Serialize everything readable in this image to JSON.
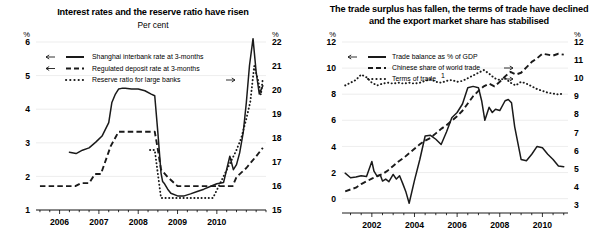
{
  "figure": {
    "left_panel": {
      "title": "Interest rates and the reserve ratio have risen",
      "subtitle": "Per cent",
      "left_unit": "%",
      "right_unit": "%"
    },
    "right_panel": {
      "title_line1": "The trade surplus has fallen, the terms of trade have declined",
      "title_line2": "and the export market share has stabilised",
      "left_unit": "%",
      "right_unit": "%"
    }
  },
  "chart_data": [
    {
      "type": "line",
      "title": "Interest rates and the reserve ratio have risen",
      "subtitle": "Per cent",
      "xlabel": "",
      "ylabel": "%",
      "xlim": [
        2005.4,
        2011.25
      ],
      "xticks": [
        2006,
        2007,
        2008,
        2009,
        2010
      ],
      "xticklabels": [
        "2006",
        "2007",
        "2008",
        "2009",
        "2010"
      ],
      "ylim": [
        1,
        6
      ],
      "yticks": [
        1,
        2,
        3,
        4,
        5,
        6
      ],
      "yticklabels": [
        "1",
        "2",
        "3",
        "4",
        "5",
        "6"
      ],
      "y2label": "%",
      "y2lim": [
        15,
        22
      ],
      "y2ticks": [
        15,
        16,
        17,
        18,
        19,
        20,
        21,
        22
      ],
      "y2ticklabels": [
        "15",
        "16",
        "17",
        "18",
        "19",
        "20",
        "21",
        "22"
      ],
      "grid": true,
      "legend_position": "upper-left",
      "series": [
        {
          "name": "Shanghai interbank rate at 3-months",
          "style": "solid",
          "axis": "left",
          "arrow": "left",
          "x": [
            2006.25,
            2006.42,
            2006.58,
            2006.75,
            2006.92,
            2007.08,
            2007.25,
            2007.33,
            2007.42,
            2007.5,
            2007.58,
            2007.67,
            2007.83,
            2008.0,
            2008.17,
            2008.33,
            2008.42,
            2008.5,
            2008.58,
            2008.62,
            2008.67,
            2008.75,
            2008.83,
            2009.0,
            2009.17,
            2009.33,
            2009.5,
            2009.67,
            2009.83,
            2010.0,
            2010.17,
            2010.33,
            2010.42,
            2010.5,
            2010.58,
            2010.67,
            2010.75,
            2010.83,
            2010.92,
            2011.0,
            2011.08,
            2011.17
          ],
          "y": [
            2.72,
            2.68,
            2.78,
            2.85,
            3.02,
            3.2,
            3.6,
            4.2,
            4.45,
            4.6,
            4.62,
            4.62,
            4.6,
            4.6,
            4.55,
            4.45,
            4.4,
            3.3,
            2.1,
            1.85,
            1.78,
            1.62,
            1.5,
            1.42,
            1.42,
            1.48,
            1.55,
            1.62,
            1.7,
            1.78,
            1.82,
            2.6,
            2.2,
            2.35,
            2.7,
            3.3,
            4.2,
            5.3,
            6.1,
            5.1,
            4.45,
            4.7
          ]
        },
        {
          "name": "Regulated deposit rate at 3-months",
          "style": "dashed",
          "axis": "left",
          "arrow": "left",
          "x": [
            2005.5,
            2006.0,
            2006.4,
            2006.55,
            2006.75,
            2006.9,
            2007.05,
            2007.3,
            2007.5,
            2007.6,
            2008.25,
            2008.42,
            2008.5,
            2008.58,
            2008.75,
            2009.0,
            2010.0,
            2010.4,
            2010.5,
            2010.75,
            2011.0,
            2011.17
          ],
          "y": [
            1.71,
            1.71,
            1.71,
            1.8,
            1.8,
            2.07,
            2.07,
            2.9,
            3.33,
            3.33,
            3.33,
            3.33,
            2.8,
            2.2,
            1.98,
            1.71,
            1.71,
            1.71,
            1.98,
            2.25,
            2.6,
            2.85
          ]
        },
        {
          "name": "Reserve ratio for large banks",
          "style": "dotted",
          "axis": "right",
          "arrow": "right",
          "x": [
            2008.3,
            2008.42,
            2008.5,
            2008.58,
            2008.67,
            2008.75,
            2009.0,
            2009.3,
            2009.58,
            2009.7,
            2009.9,
            2010.05,
            2010.2,
            2010.35,
            2010.5,
            2010.62,
            2010.75,
            2010.85,
            2010.95,
            2011.05,
            2011.12,
            2011.17
          ],
          "y": [
            17.5,
            17.5,
            16.5,
            15.5,
            15.5,
            15.5,
            15.5,
            15.5,
            15.5,
            15.5,
            15.5,
            16.0,
            16.5,
            17.0,
            17.5,
            18.0,
            18.8,
            19.5,
            21.0,
            20.4,
            19.8,
            20.5
          ]
        }
      ]
    },
    {
      "type": "line",
      "title": "The trade surplus has fallen, the terms of trade have declined and the export market share has stabilised",
      "subtitle": "",
      "xlabel": "",
      "ylabel": "%",
      "xlim": [
        2000.6,
        2011.2
      ],
      "xticks": [
        2002,
        2004,
        2006,
        2008,
        2010
      ],
      "xticklabels": [
        "2002",
        "2004",
        "2006",
        "2008",
        "2010"
      ],
      "ylim": [
        -1.1,
        12
      ],
      "yticks": [
        0,
        2,
        4,
        6,
        8,
        10,
        12
      ],
      "yticklabels": [
        "0",
        "2",
        "4",
        "6",
        "8",
        "10",
        "12"
      ],
      "y2label": "%",
      "y2lim": [
        2.55,
        12
      ],
      "y2ticks": [
        3,
        4,
        5,
        6,
        7,
        8,
        9,
        10,
        11,
        12
      ],
      "y2ticklabels": [
        "3",
        "4",
        "5",
        "6",
        "7",
        "8",
        "9",
        "10",
        "11",
        "12"
      ],
      "grid": true,
      "legend_position": "upper-left",
      "footnote_marker": "1",
      "series": [
        {
          "name": "Trade balance as % of GDP",
          "style": "solid",
          "axis": "left",
          "arrow": "left",
          "x": [
            2000.75,
            2001.0,
            2001.25,
            2001.5,
            2001.75,
            2002.0,
            2002.1,
            2002.25,
            2002.4,
            2002.5,
            2002.65,
            2002.8,
            2003.0,
            2003.15,
            2003.3,
            2003.45,
            2003.6,
            2003.75,
            2004.0,
            2004.25,
            2004.5,
            2004.75,
            2005.0,
            2005.25,
            2005.5,
            2005.75,
            2006.0,
            2006.25,
            2006.5,
            2006.75,
            2007.0,
            2007.15,
            2007.3,
            2007.5,
            2007.65,
            2007.8,
            2008.0,
            2008.25,
            2008.4,
            2008.55,
            2008.7,
            2009.0,
            2009.25,
            2009.5,
            2009.75,
            2010.0,
            2010.25,
            2010.5,
            2010.75,
            2011.0
          ],
          "y": [
            1.95,
            1.6,
            1.65,
            1.75,
            1.7,
            2.85,
            2.1,
            1.7,
            1.8,
            1.35,
            1.5,
            1.3,
            1.85,
            1.5,
            1.75,
            1.15,
            0.5,
            -0.35,
            1.4,
            3.0,
            4.8,
            4.85,
            4.55,
            4.15,
            5.1,
            6.2,
            6.6,
            7.25,
            8.5,
            8.6,
            8.5,
            7.5,
            6.0,
            7.0,
            6.6,
            6.85,
            6.75,
            7.5,
            7.6,
            7.35,
            5.5,
            3.0,
            2.9,
            3.4,
            4.0,
            3.9,
            3.4,
            3.0,
            2.5,
            2.45
          ]
        },
        {
          "name": "Chinese share of world trade",
          "style": "dashed",
          "axis": "right",
          "arrow": "right",
          "x": [
            2000.75,
            2001.0,
            2001.25,
            2001.5,
            2001.75,
            2002.0,
            2002.25,
            2002.5,
            2002.75,
            2003.0,
            2003.25,
            2003.5,
            2003.75,
            2004.0,
            2004.25,
            2004.5,
            2004.75,
            2005.0,
            2005.25,
            2005.5,
            2005.75,
            2006.0,
            2006.25,
            2006.5,
            2006.75,
            2007.0,
            2007.25,
            2007.5,
            2007.75,
            2008.0,
            2008.25,
            2008.5,
            2008.75,
            2009.0,
            2009.25,
            2009.5,
            2009.75,
            2010.0,
            2010.25,
            2010.5,
            2010.75,
            2011.0
          ],
          "y": [
            3.75,
            3.85,
            3.95,
            4.15,
            4.3,
            4.45,
            4.6,
            4.7,
            4.9,
            5.15,
            5.4,
            5.6,
            5.85,
            6.1,
            6.35,
            6.55,
            6.7,
            6.95,
            7.2,
            7.4,
            7.65,
            7.9,
            8.2,
            8.6,
            9.0,
            9.3,
            9.55,
            9.7,
            9.55,
            9.8,
            10.1,
            10.35,
            10.2,
            10.3,
            10.6,
            10.9,
            11.1,
            11.35,
            11.3,
            11.25,
            11.35,
            11.3
          ]
        },
        {
          "name": "Terms of trade",
          "style": "dotted",
          "axis": "right",
          "arrow": "right",
          "x": [
            2000.75,
            2001.0,
            2001.25,
            2001.5,
            2001.75,
            2002.0,
            2002.25,
            2002.5,
            2002.75,
            2003.0,
            2003.25,
            2003.5,
            2003.75,
            2004.0,
            2004.25,
            2004.5,
            2004.75,
            2005.0,
            2005.25,
            2005.5,
            2005.75,
            2006.0,
            2006.25,
            2006.5,
            2006.75,
            2007.0,
            2007.25,
            2007.5,
            2007.75,
            2008.0,
            2008.25,
            2008.5,
            2008.75,
            2009.0,
            2009.25,
            2009.5,
            2009.75,
            2010.0,
            2010.25,
            2010.5,
            2010.75,
            2011.0
          ],
          "y": [
            9.6,
            9.75,
            9.9,
            10.2,
            10.05,
            9.75,
            9.6,
            9.7,
            9.75,
            9.7,
            9.75,
            9.7,
            9.75,
            9.7,
            9.75,
            9.85,
            9.95,
            9.8,
            9.75,
            9.85,
            9.9,
            9.8,
            9.85,
            10.0,
            10.15,
            10.3,
            10.45,
            10.25,
            10.0,
            9.9,
            10.0,
            9.75,
            9.6,
            9.8,
            9.7,
            9.55,
            9.4,
            9.3,
            9.2,
            9.15,
            9.1,
            9.15
          ]
        }
      ]
    }
  ]
}
